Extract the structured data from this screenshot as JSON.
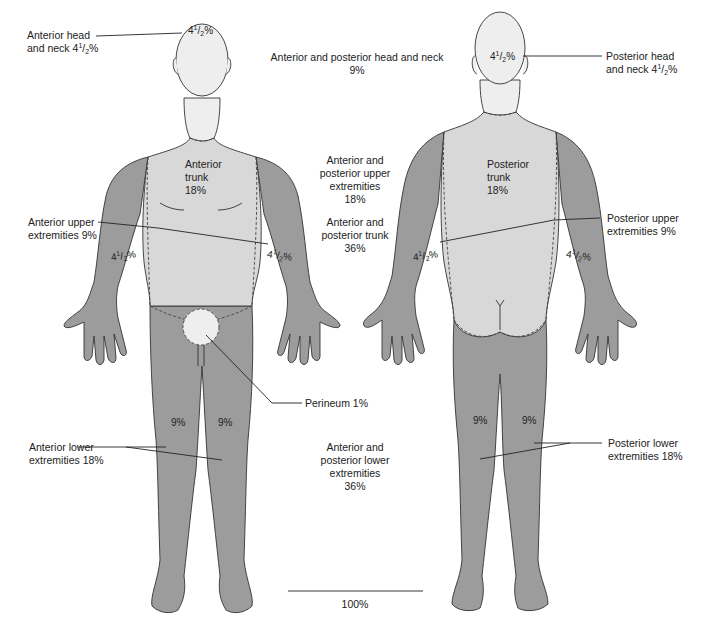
{
  "diagram": {
    "colors": {
      "background": "#ffffff",
      "head_fill": "#eeeeee",
      "trunk_fill": "#d8d8d8",
      "limb_fill": "#9c9c9c",
      "perineum_fill": "#eeeeee",
      "outline": "#333333",
      "text": "#222222"
    },
    "anterior_figure": {
      "head": {
        "value_whole": "4",
        "value_num": "1",
        "value_den": "2",
        "unit": "%"
      },
      "trunk": {
        "line1": "Anterior",
        "line2": "trunk",
        "line3": "18%"
      },
      "left_arm": {
        "value_whole": "4",
        "value_num": "1",
        "value_den": "2",
        "unit": "%"
      },
      "right_arm": {
        "value_whole": "4",
        "value_num": "1",
        "value_den": "2",
        "unit": "%"
      },
      "left_leg": "9%",
      "right_leg": "9%"
    },
    "posterior_figure": {
      "head": {
        "value_whole": "4",
        "value_num": "1",
        "value_den": "2",
        "unit": "%"
      },
      "trunk": {
        "line1": "Posterior",
        "line2": "trunk",
        "line3": "18%"
      },
      "left_arm": {
        "value_whole": "4",
        "value_num": "1",
        "value_den": "2",
        "unit": "%"
      },
      "right_arm": {
        "value_whole": "4",
        "value_num": "1",
        "value_den": "2",
        "unit": "%"
      },
      "left_leg": "9%",
      "right_leg": "9%"
    },
    "callouts_left": {
      "anterior_head": {
        "line1": "Anterior head",
        "line2_prefix": "and neck 4",
        "num": "1",
        "den": "2",
        "unit": "%"
      },
      "anterior_upper": {
        "line1": "Anterior upper",
        "line2": "extremities 9%"
      },
      "anterior_lower": {
        "line1": "Anterior lower",
        "line2": "extremities 18%"
      }
    },
    "callouts_right": {
      "posterior_head": {
        "line1": "Posterior head",
        "line2_prefix": "and neck 4",
        "num": "1",
        "den": "2",
        "unit": "%"
      },
      "posterior_upper": {
        "line1": "Posterior upper",
        "line2": "extremities 9%"
      },
      "posterior_lower": {
        "line1": "Posterior lower",
        "line2": "extremities 18%"
      },
      "perineum": "Perineum 1%"
    },
    "totals": {
      "head_neck": {
        "line1": "Anterior and posterior head and neck",
        "line2": "9%"
      },
      "upper_ext": {
        "line1": "Anterior and",
        "line2": "posterior upper",
        "line3": "extremities",
        "line4": "18%"
      },
      "trunk": {
        "line1": "Anterior and",
        "line2": "posterior trunk",
        "line3": "36%"
      },
      "lower_ext": {
        "line1": "Anterior and",
        "line2": "posterior lower",
        "line3": "extremities",
        "line4": "36%"
      },
      "grand_total": "100%"
    }
  }
}
